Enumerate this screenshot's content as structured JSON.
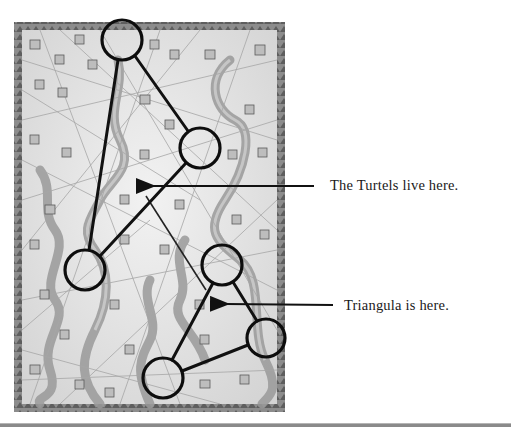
{
  "figure": {
    "type": "game-manual-map-illustration",
    "map": {
      "frame": {
        "x": 14,
        "y": 22,
        "width": 271,
        "height": 390
      },
      "colors": {
        "parchment": "#e6e6e6",
        "border": "#7a7a7a",
        "river": "#9c9c9c",
        "ink": "#111111",
        "faint_lines": "#a8a8a8"
      }
    },
    "locations": [
      {
        "id": "c1",
        "cx": 122,
        "cy": 40,
        "r": 20
      },
      {
        "id": "c2",
        "cx": 200,
        "cy": 148,
        "r": 20
      },
      {
        "id": "c3",
        "cx": 85,
        "cy": 270,
        "r": 20
      },
      {
        "id": "c4",
        "cx": 222,
        "cy": 265,
        "r": 20
      },
      {
        "id": "c5",
        "cx": 266,
        "cy": 338,
        "r": 19
      },
      {
        "id": "c6",
        "cx": 163,
        "cy": 378,
        "r": 20
      }
    ],
    "connections": [
      {
        "from": "c1",
        "to": "c3"
      },
      {
        "from": "c1",
        "to": "c2"
      },
      {
        "from": "c2",
        "to": "c3"
      },
      {
        "from": "c4",
        "to": "c6"
      },
      {
        "from": "c4",
        "to": "c5"
      },
      {
        "from": "c5",
        "to": "c6"
      }
    ],
    "annotations": [
      {
        "id": "turtels",
        "label": "The Turtels live here.",
        "arrow": {
          "x1": 314,
          "y1": 186,
          "x2": 148,
          "y2": 186
        }
      },
      {
        "id": "triangula",
        "label": "Triangula is here.",
        "arrow": {
          "x1": 333,
          "y1": 305,
          "x2": 222,
          "y2": 304
        }
      }
    ]
  }
}
